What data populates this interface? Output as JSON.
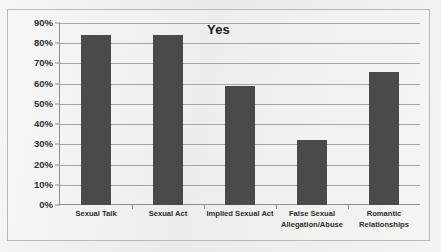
{
  "chart_data": {
    "type": "bar",
    "title": "Yes",
    "xlabel": "",
    "ylabel": "",
    "categories": [
      "Sexual Talk",
      "Sexual Act",
      "Implied Sexual Act",
      "False Sexual Allegation/Abuse",
      "Romantic Relationships"
    ],
    "category_lines": [
      [
        "Sexual Talk"
      ],
      [
        "Sexual Act"
      ],
      [
        "Implied Sexual Act"
      ],
      [
        "False Sexual",
        "Allegation/Abuse"
      ],
      [
        "Romantic",
        "Relationships"
      ]
    ],
    "values": [
      84,
      84,
      59,
      32,
      66
    ],
    "ylim": [
      0,
      90
    ],
    "ytick_values": [
      0,
      10,
      20,
      30,
      40,
      50,
      60,
      70,
      80,
      90
    ],
    "ytick_labels": [
      "0%",
      "10%",
      "20%",
      "30%",
      "40%",
      "50%",
      "60%",
      "70%",
      "80%",
      "90%"
    ],
    "grid": true,
    "legend": false,
    "bar_color": "#4a4a4a",
    "gridline_color": "#a6a6a6",
    "axis_color": "#8f8f8f",
    "background_color": "#ececeb"
  }
}
